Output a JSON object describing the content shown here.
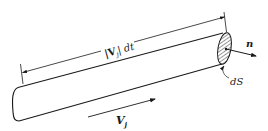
{
  "diagram": {
    "title": "",
    "labels": {
      "length": "|V",
      "length_sub": "j",
      "length_tail": "| dt",
      "normal": "n",
      "area": "dS",
      "velocity": "V",
      "velocity_sub": "j"
    },
    "colors": {
      "stroke": "#1a1a1a",
      "background": "#ffffff"
    }
  }
}
